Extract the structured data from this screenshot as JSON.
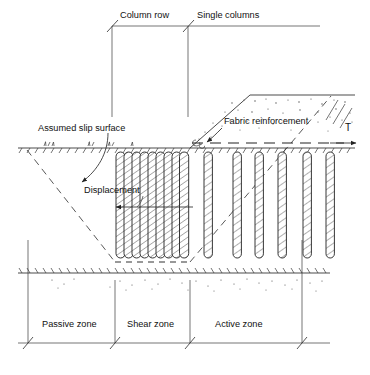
{
  "figure": {
    "type": "engineering-cross-section"
  },
  "labels": {
    "column_row": "Column row",
    "single_columns": "Single columns",
    "assumed_slip_surface": "Assumed slip surface",
    "fabric_reinforcement": "Fabric reinforcement",
    "displacement": "Displacement",
    "tensile_force": "T",
    "passive_zone": "Passive zone",
    "shear_zone": "Shear zone",
    "active_zone": "Active zone"
  },
  "zones": [
    {
      "name": "Passive zone",
      "x_start": 28,
      "x_end": 115
    },
    {
      "name": "Shear zone",
      "x_start": 115,
      "x_end": 190
    },
    {
      "name": "Active zone",
      "x_start": 190,
      "x_end": 302
    }
  ],
  "top_dimension": {
    "line_y": 26,
    "x_start": 112,
    "x_mid": 188,
    "x_end": 320,
    "segments": [
      {
        "label": "Column row",
        "x_start": 112,
        "x_end": 188
      },
      {
        "label": "Single columns",
        "x_start": 188,
        "x_end": 320
      }
    ]
  },
  "bottom_dimension": {
    "line_y": 343,
    "ticks": [
      28,
      115,
      190,
      302
    ],
    "x_start": 18,
    "x_end": 330
  },
  "geometry": {
    "ground_line_y": 148,
    "bedrock_line_y": 273,
    "ground_x_start": 18,
    "ground_x_end": 355,
    "embankment": {
      "toe_x": 190,
      "toe_y": 148,
      "crest_x": 250,
      "crest_y": 95,
      "crest_end_x": 355
    },
    "fabric_layer_y": 143,
    "fabric_x_start": 192,
    "fabric_x_end": 356,
    "displacement_arrow": {
      "y": 207,
      "x_tip": 116,
      "x_tail": 193
    },
    "slip_left": {
      "x1": 27,
      "y1": 150,
      "x2": 115,
      "y2": 262
    },
    "slip_right": {
      "x1": 190,
      "y1": 262,
      "x2": 331,
      "y2": 96
    }
  },
  "column_row": {
    "count": 9,
    "x_start": 116,
    "x_end": 188,
    "top_y": 152,
    "bottom_y": 258,
    "width": 9.2
  },
  "single_columns": {
    "count": 6,
    "positions": [
      208,
      237,
      259,
      282,
      307,
      330
    ],
    "top_y": 152,
    "bottom_y": 258,
    "width": 8.4
  },
  "colors": {
    "line": "#2b2b2b",
    "background": "#ffffff",
    "hatch": "#2d2d2d",
    "speck": "#4a4a4a"
  }
}
